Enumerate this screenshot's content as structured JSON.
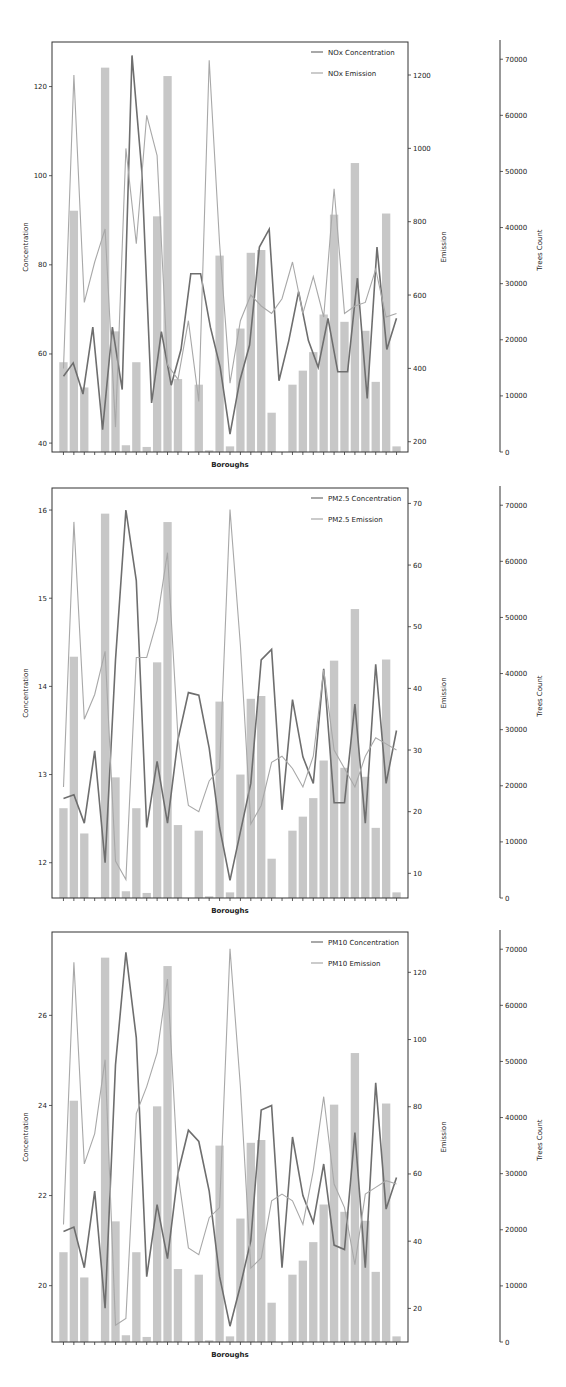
{
  "chart_data": [
    {
      "type": "bar+line",
      "title": "",
      "xlabel": "Boroughs",
      "ylabel": "Concentration",
      "y2label": "Emission",
      "y3label": "Trees Count",
      "ylim": [
        38,
        130
      ],
      "y2lim": [
        172,
        1290
      ],
      "y3lim": [
        0,
        72000
      ],
      "yticks": [
        40,
        60,
        80,
        100,
        120
      ],
      "y2ticks": [
        200,
        400,
        600,
        800,
        1000,
        1200
      ],
      "y3ticks": [
        0,
        10000,
        20000,
        30000,
        40000,
        50000,
        60000,
        70000
      ],
      "legend": [
        "NOx Concentration",
        "NOx Emission"
      ],
      "legend_position": "upper right",
      "grid": false,
      "categories_count": 33,
      "series": [
        {
          "name": "Trees Count",
          "kind": "bar",
          "color": "#bdbdbd",
          "values": [
            16000,
            43000,
            11500,
            0,
            68500,
            21500,
            1200,
            16000,
            900,
            42000,
            67000,
            13000,
            0,
            12000,
            300,
            35000,
            1000,
            22000,
            35500,
            36000,
            7000,
            0,
            12000,
            14500,
            17800,
            24500,
            42300,
            23200,
            51500,
            21600,
            12500,
            42500,
            1000
          ]
        },
        {
          "name": "NOx Concentration",
          "kind": "line",
          "axis": "left",
          "color": "#6e6e6e",
          "values": [
            55,
            58,
            51,
            66,
            43,
            66,
            52,
            127,
            101,
            49,
            65,
            53,
            61,
            78,
            78,
            66,
            57,
            42,
            54,
            62,
            84,
            88,
            54,
            63,
            74,
            63,
            57,
            68,
            56,
            56,
            77,
            50,
            84,
            61,
            68
          ]
        },
        {
          "name": "NOx Emission",
          "kind": "line",
          "axis": "right",
          "color": "#a8a8a8",
          "values": [
            400,
            1200,
            580,
            690,
            780,
            240,
            1000,
            740,
            1090,
            980,
            410,
            370,
            530,
            310,
            1240,
            740,
            360,
            530,
            600,
            570,
            550,
            590,
            690,
            550,
            650,
            540,
            890,
            550,
            570,
            580,
            670,
            540,
            550
          ]
        }
      ]
    },
    {
      "type": "bar+line",
      "title": "",
      "xlabel": "Boroughs",
      "ylabel": "Concentration",
      "y2label": "Emission",
      "y3label": "Trees Count",
      "ylim": [
        11.6,
        16.25
      ],
      "y2lim": [
        6,
        72.5
      ],
      "y3lim": [
        0,
        72000
      ],
      "yticks": [
        12,
        13,
        14,
        15,
        16
      ],
      "y2ticks": [
        10,
        20,
        30,
        40,
        50,
        60,
        70
      ],
      "y3ticks": [
        0,
        10000,
        20000,
        30000,
        40000,
        50000,
        60000,
        70000
      ],
      "legend": [
        "PM2.5 Concentration",
        "PM2.5 Emission"
      ],
      "legend_position": "upper right",
      "grid": false,
      "categories_count": 33,
      "series": [
        {
          "name": "Trees Count",
          "kind": "bar",
          "color": "#bdbdbd",
          "values": [
            16000,
            43000,
            11500,
            0,
            68500,
            21500,
            1200,
            16000,
            900,
            42000,
            67000,
            13000,
            0,
            12000,
            300,
            35000,
            1000,
            22000,
            35500,
            36000,
            7000,
            0,
            12000,
            14500,
            17800,
            24500,
            42300,
            23200,
            51500,
            21600,
            12500,
            42500,
            1000
          ]
        },
        {
          "name": "PM2.5 Concentration",
          "kind": "line",
          "axis": "left",
          "color": "#6e6e6e",
          "values": [
            12.73,
            12.77,
            12.45,
            13.27,
            12.0,
            14.3,
            16.0,
            15.2,
            12.4,
            13.15,
            12.45,
            13.4,
            13.93,
            13.9,
            13.3,
            12.4,
            11.8,
            12.35,
            12.9,
            14.3,
            14.42,
            12.6,
            13.85,
            13.2,
            12.9,
            14.2,
            12.68,
            12.68,
            13.8,
            12.45,
            14.25,
            12.9,
            13.5
          ]
        },
        {
          "name": "PM2.5 Emission",
          "kind": "line",
          "axis": "right",
          "color": "#a8a8a8",
          "values": [
            24,
            67,
            35,
            39,
            46,
            12,
            9,
            45,
            45,
            51,
            62,
            32,
            21,
            20,
            25,
            27,
            69,
            47,
            18,
            21,
            28,
            29,
            27,
            24,
            29,
            43,
            30,
            27,
            24,
            29,
            32,
            31,
            30
          ]
        }
      ]
    },
    {
      "type": "bar+line",
      "title": "",
      "xlabel": "Boroughs",
      "ylabel": "Concentration",
      "y2label": "Emission",
      "y3label": "Trees Count",
      "ylim": [
        18.75,
        27.85
      ],
      "y2lim": [
        10,
        132
      ],
      "y3lim": [
        0,
        72000
      ],
      "yticks": [
        20,
        22,
        24,
        26
      ],
      "y2ticks": [
        20,
        40,
        60,
        80,
        100,
        120
      ],
      "y3ticks": [
        0,
        10000,
        20000,
        30000,
        40000,
        50000,
        60000,
        70000
      ],
      "legend": [
        "PM10 Concentration",
        "PM10 Emission"
      ],
      "legend_position": "upper right",
      "grid": false,
      "categories_count": 33,
      "series": [
        {
          "name": "Trees Count",
          "kind": "bar",
          "color": "#bdbdbd",
          "values": [
            16000,
            43000,
            11500,
            0,
            68500,
            21500,
            1200,
            16000,
            900,
            42000,
            67000,
            13000,
            0,
            12000,
            300,
            35000,
            1000,
            22000,
            35500,
            36000,
            7000,
            0,
            12000,
            14500,
            17800,
            24500,
            42300,
            23200,
            51500,
            21600,
            12500,
            42500,
            1000
          ]
        },
        {
          "name": "PM10 Concentration",
          "kind": "line",
          "axis": "left",
          "color": "#6e6e6e",
          "values": [
            21.2,
            21.3,
            20.4,
            22.1,
            19.5,
            24.9,
            27.4,
            25.5,
            20.2,
            21.8,
            20.6,
            22.5,
            23.45,
            23.2,
            22.1,
            20.2,
            19.1,
            20.0,
            21.0,
            23.9,
            24.0,
            20.4,
            23.3,
            22.0,
            21.4,
            22.7,
            20.9,
            20.8,
            23.4,
            20.4,
            24.5,
            21.7,
            22.4
          ]
        },
        {
          "name": "PM10 Emission",
          "kind": "line",
          "axis": "right",
          "color": "#a8a8a8",
          "values": [
            45,
            123,
            63,
            72,
            94,
            15,
            17,
            78,
            86,
            96,
            118,
            60,
            38,
            36,
            47,
            50,
            127,
            86,
            32,
            35,
            52,
            54,
            52,
            45,
            61,
            83,
            57,
            50,
            33,
            54,
            56,
            58,
            57
          ]
        }
      ]
    }
  ]
}
